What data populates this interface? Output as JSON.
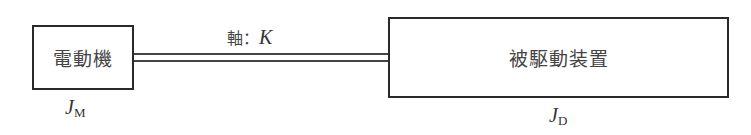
{
  "diagram": {
    "motor": {
      "label": "電動機",
      "inertia_symbol": "J",
      "inertia_subscript": "M"
    },
    "shaft": {
      "label_prefix": "軸",
      "separator": "：",
      "stiffness_symbol": "K"
    },
    "driven": {
      "label": "被駆動装置",
      "inertia_symbol": "J",
      "inertia_subscript": "D"
    },
    "colors": {
      "line": "#2a2a2a",
      "text": "#444444",
      "background": "#ffffff"
    }
  }
}
